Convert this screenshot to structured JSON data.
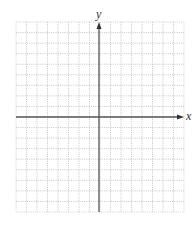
{
  "graph": {
    "x_axis_label": "x",
    "y_axis_label": "y",
    "grid": {
      "columns": 16,
      "rows": 18,
      "style": "dotted",
      "line_color": "#b8b8b8",
      "axis_color": "#555555"
    }
  }
}
